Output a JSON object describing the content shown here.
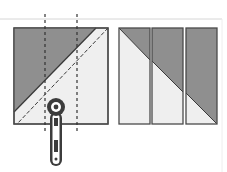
{
  "diagram": {
    "colors": {
      "dark_fabric": "#8f8f8f",
      "light_fabric": "#efefef",
      "outline": "#4a4a4a",
      "guide_line": "#cfcfcf",
      "cutter_body": "#3c3c3c"
    },
    "left_block": {
      "label": "half-square triangle with cut lines",
      "cut_lines": 2
    },
    "right_strips": {
      "count": 3
    },
    "tool": "rotary cutter"
  }
}
